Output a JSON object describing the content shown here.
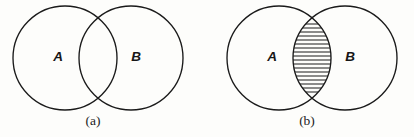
{
  "figure": {
    "background_color": "#fdfdfb",
    "stroke_color": "#1a1a1a",
    "panel_count": 2
  },
  "panels": [
    {
      "id": "panel-a",
      "caption": "(a)",
      "caption_x": 93,
      "caption_y": 122,
      "shaded_region": "none",
      "circles": [
        {
          "label": "A",
          "cx": 65,
          "cy": 58,
          "r": 52,
          "label_x": 58,
          "label_y": 57
        },
        {
          "label": "B",
          "cx": 131,
          "cy": 58,
          "r": 52,
          "label_x": 136,
          "label_y": 57
        }
      ],
      "intersection": {
        "top_crossing_x": 99,
        "top_crossing_y": 22,
        "bottom_crossing_x": 99,
        "bottom_crossing_y": 95,
        "hatched": false
      }
    },
    {
      "id": "panel-b",
      "caption": "(b)",
      "caption_x": 307,
      "caption_y": 122,
      "shaded_region": "A-intersect-B",
      "circles": [
        {
          "label": "A",
          "cx": 279,
          "cy": 58,
          "r": 52,
          "label_x": 272,
          "label_y": 57
        },
        {
          "label": "B",
          "cx": 345,
          "cy": 58,
          "r": 52,
          "label_x": 350,
          "label_y": 57
        }
      ],
      "intersection": {
        "top_crossing_x": 313,
        "top_crossing_y": 22,
        "bottom_crossing_x": 313,
        "bottom_crossing_y": 95,
        "hatched": true,
        "hatch_style": "horizontal-lines",
        "hatch_spacing": 4,
        "hatch_color": "#1a1a1a"
      }
    }
  ]
}
